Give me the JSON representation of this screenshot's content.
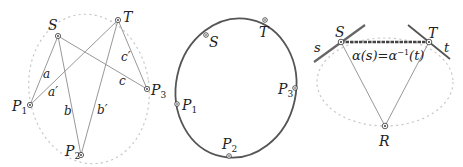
{
  "colors": {
    "line": "#8c8c8c",
    "curve": "#555555",
    "dots": "#c8c8c8",
    "thick": "#444444",
    "point": "#333333"
  },
  "panel1": {
    "points": {
      "S": {
        "label": "S",
        "x": 58,
        "y": 36
      },
      "T": {
        "label": "T",
        "x": 118,
        "y": 20
      },
      "P1": {
        "label": "P",
        "sub": "1",
        "x": 30,
        "y": 105
      },
      "P2": {
        "label": "P",
        "sub": "2",
        "x": 81,
        "y": 155
      },
      "P3": {
        "label": "P",
        "sub": "3",
        "x": 147,
        "y": 89
      }
    },
    "segments": {
      "a": "a",
      "a_prime": "a′",
      "b": "b",
      "b_prime": "b′",
      "c": "c",
      "c_prime": "c′"
    }
  },
  "panel2": {
    "points": {
      "S": {
        "label": "S"
      },
      "T": {
        "label": "T"
      },
      "P1": {
        "label": "P",
        "sub": "1"
      },
      "P2": {
        "label": "P",
        "sub": "2"
      },
      "P3": {
        "label": "P",
        "sub": "3"
      }
    }
  },
  "panel3": {
    "points": {
      "S": {
        "label": "S"
      },
      "T": {
        "label": "T"
      },
      "R": {
        "label": "R"
      }
    },
    "tangents": {
      "s": "s",
      "t": "t"
    },
    "equation": {
      "left": "α(s)=α",
      "exp": "−1",
      "right": "(t)"
    }
  }
}
